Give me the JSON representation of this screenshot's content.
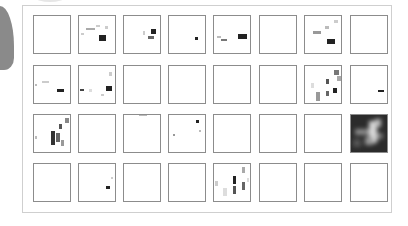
{
  "figure": {
    "rows": 4,
    "columns": 8,
    "colors": {
      "panel_border": "#cfcfcf",
      "cell_border": "#8c8c8c",
      "side_shape": "#8a8a8a",
      "dark_cell_bg": "#2e2e2e"
    },
    "cells": [
      {
        "row": 0,
        "col": 0,
        "state": "empty"
      },
      {
        "row": 0,
        "col": 1,
        "state": "sparse",
        "marks": [
          {
            "x": 20,
            "y": 19,
            "w": 7,
            "h": 6,
            "c": "#222"
          },
          {
            "x": 7,
            "y": 12,
            "w": 9,
            "h": 2,
            "c": "#aaa"
          },
          {
            "x": 17,
            "y": 9,
            "w": 4,
            "h": 2,
            "c": "#ccc"
          },
          {
            "x": 2,
            "y": 17,
            "w": 3,
            "h": 2,
            "c": "#ccc"
          },
          {
            "x": 26,
            "y": 10,
            "w": 3,
            "h": 3,
            "c": "#ccc"
          }
        ]
      },
      {
        "row": 0,
        "col": 2,
        "state": "sparse",
        "marks": [
          {
            "x": 27,
            "y": 13,
            "w": 5,
            "h": 5,
            "c": "#222"
          },
          {
            "x": 24,
            "y": 20,
            "w": 6,
            "h": 3,
            "c": "#666"
          },
          {
            "x": 19,
            "y": 15,
            "w": 2,
            "h": 4,
            "c": "#ccc"
          }
        ]
      },
      {
        "row": 0,
        "col": 3,
        "state": "sparse",
        "marks": [
          {
            "x": 26,
            "y": 21,
            "w": 3,
            "h": 3,
            "c": "#222"
          }
        ]
      },
      {
        "row": 0,
        "col": 4,
        "state": "sparse",
        "marks": [
          {
            "x": 24,
            "y": 18,
            "w": 9,
            "h": 5,
            "c": "#222"
          },
          {
            "x": 7,
            "y": 23,
            "w": 6,
            "h": 2,
            "c": "#777"
          },
          {
            "x": 3,
            "y": 20,
            "w": 4,
            "h": 2,
            "c": "#bbb"
          }
        ]
      },
      {
        "row": 0,
        "col": 5,
        "state": "empty"
      },
      {
        "row": 0,
        "col": 6,
        "state": "sparse",
        "marks": [
          {
            "x": 22,
            "y": 23,
            "w": 8,
            "h": 5,
            "c": "#222"
          },
          {
            "x": 8,
            "y": 15,
            "w": 8,
            "h": 3,
            "c": "#999"
          },
          {
            "x": 20,
            "y": 10,
            "w": 4,
            "h": 3,
            "c": "#bbb"
          },
          {
            "x": 29,
            "y": 4,
            "w": 4,
            "h": 3,
            "c": "#ccc"
          }
        ]
      },
      {
        "row": 0,
        "col": 7,
        "state": "empty"
      },
      {
        "row": 1,
        "col": 0,
        "state": "sparse",
        "marks": [
          {
            "x": 23,
            "y": 23,
            "w": 7,
            "h": 3,
            "c": "#222"
          },
          {
            "x": 8,
            "y": 15,
            "w": 7,
            "h": 2,
            "c": "#ccc"
          },
          {
            "x": 1,
            "y": 18,
            "w": 2,
            "h": 2,
            "c": "#bbb"
          }
        ]
      },
      {
        "row": 1,
        "col": 1,
        "state": "sparse",
        "marks": [
          {
            "x": 27,
            "y": 20,
            "w": 6,
            "h": 5,
            "c": "#222"
          },
          {
            "x": 1,
            "y": 23,
            "w": 4,
            "h": 2,
            "c": "#444"
          },
          {
            "x": 30,
            "y": 6,
            "w": 3,
            "h": 4,
            "c": "#ccc"
          },
          {
            "x": 10,
            "y": 23,
            "w": 3,
            "h": 3,
            "c": "#ddd"
          },
          {
            "x": 22,
            "y": 28,
            "w": 3,
            "h": 2,
            "c": "#ccc"
          }
        ]
      },
      {
        "row": 1,
        "col": 2,
        "state": "empty"
      },
      {
        "row": 1,
        "col": 3,
        "state": "empty"
      },
      {
        "row": 1,
        "col": 4,
        "state": "empty"
      },
      {
        "row": 1,
        "col": 5,
        "state": "empty"
      },
      {
        "row": 1,
        "col": 6,
        "state": "sparse",
        "marks": [
          {
            "x": 28,
            "y": 22,
            "w": 4,
            "h": 5,
            "c": "#222"
          },
          {
            "x": 29,
            "y": 4,
            "w": 5,
            "h": 5,
            "c": "#777"
          },
          {
            "x": 32,
            "y": 10,
            "w": 4,
            "h": 5,
            "c": "#aaa"
          },
          {
            "x": 21,
            "y": 13,
            "w": 3,
            "h": 5,
            "c": "#555"
          },
          {
            "x": 21,
            "y": 25,
            "w": 3,
            "h": 5,
            "c": "#666"
          },
          {
            "x": 11,
            "y": 26,
            "w": 4,
            "h": 9,
            "c": "#999"
          },
          {
            "x": 6,
            "y": 17,
            "w": 3,
            "h": 5,
            "c": "#ddd"
          }
        ]
      },
      {
        "row": 1,
        "col": 7,
        "state": "sparse",
        "marks": [
          {
            "x": 27,
            "y": 24,
            "w": 6,
            "h": 2,
            "c": "#222"
          }
        ]
      },
      {
        "row": 2,
        "col": 0,
        "state": "sparse",
        "marks": [
          {
            "x": 17,
            "y": 16,
            "w": 4,
            "h": 14,
            "c": "#333"
          },
          {
            "x": 22,
            "y": 18,
            "w": 4,
            "h": 9,
            "c": "#666"
          },
          {
            "x": 25,
            "y": 9,
            "w": 3,
            "h": 5,
            "c": "#555"
          },
          {
            "x": 31,
            "y": 3,
            "w": 4,
            "h": 5,
            "c": "#888"
          },
          {
            "x": 27,
            "y": 25,
            "w": 3,
            "h": 6,
            "c": "#999"
          },
          {
            "x": 1,
            "y": 21,
            "w": 2,
            "h": 3,
            "c": "#bbb"
          }
        ]
      },
      {
        "row": 2,
        "col": 1,
        "state": "empty"
      },
      {
        "row": 2,
        "col": 2,
        "state": "sparse",
        "marks": [
          {
            "x": 15,
            "y": 0,
            "w": 8,
            "h": 1,
            "c": "#bbb"
          }
        ]
      },
      {
        "row": 2,
        "col": 3,
        "state": "sparse",
        "marks": [
          {
            "x": 27,
            "y": 5,
            "w": 3,
            "h": 3,
            "c": "#222"
          },
          {
            "x": 30,
            "y": 15,
            "w": 2,
            "h": 2,
            "c": "#bbb"
          },
          {
            "x": 4,
            "y": 19,
            "w": 2,
            "h": 2,
            "c": "#999"
          }
        ]
      },
      {
        "row": 2,
        "col": 4,
        "state": "empty"
      },
      {
        "row": 2,
        "col": 5,
        "state": "empty"
      },
      {
        "row": 2,
        "col": 6,
        "state": "empty"
      },
      {
        "row": 2,
        "col": 7,
        "state": "dense"
      },
      {
        "row": 3,
        "col": 0,
        "state": "empty"
      },
      {
        "row": 3,
        "col": 1,
        "state": "sparse",
        "marks": [
          {
            "x": 27,
            "y": 22,
            "w": 4,
            "h": 3,
            "c": "#222"
          },
          {
            "x": 32,
            "y": 13,
            "w": 2,
            "h": 2,
            "c": "#ccc"
          }
        ]
      },
      {
        "row": 3,
        "col": 2,
        "state": "empty"
      },
      {
        "row": 3,
        "col": 3,
        "state": "empty"
      },
      {
        "row": 3,
        "col": 4,
        "state": "sparse",
        "marks": [
          {
            "x": 19,
            "y": 12,
            "w": 3,
            "h": 8,
            "c": "#222"
          },
          {
            "x": 19,
            "y": 22,
            "w": 3,
            "h": 8,
            "c": "#555"
          },
          {
            "x": 28,
            "y": 18,
            "w": 3,
            "h": 8,
            "c": "#666"
          },
          {
            "x": 28,
            "y": 3,
            "w": 3,
            "h": 6,
            "c": "#aaa"
          },
          {
            "x": 9,
            "y": 24,
            "w": 4,
            "h": 8,
            "c": "#ddd"
          },
          {
            "x": 1,
            "y": 17,
            "w": 3,
            "h": 5,
            "c": "#ccc"
          },
          {
            "x": 33,
            "y": 14,
            "w": 2,
            "h": 4,
            "c": "#ddd"
          }
        ]
      },
      {
        "row": 3,
        "col": 5,
        "state": "empty"
      },
      {
        "row": 3,
        "col": 6,
        "state": "empty"
      },
      {
        "row": 3,
        "col": 7,
        "state": "empty"
      }
    ]
  }
}
